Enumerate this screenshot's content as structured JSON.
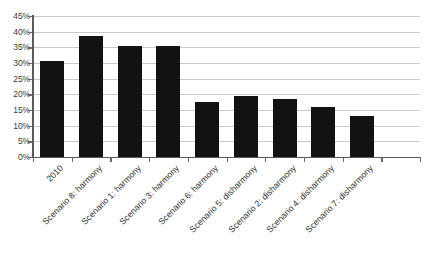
{
  "chart_data": {
    "type": "bar",
    "title": "",
    "subtitle": "",
    "xlabel": "",
    "ylabel": "",
    "categories": [
      "2010",
      "Scenario 8: harmony",
      "Scenario 1: harmony",
      "Scenario 3: harmony",
      "Scenario 6: harmony",
      "Scenario 5: disharmony",
      "Scenario 2: disharmony",
      "Scenario 4: disharmony",
      "Scenario 7: disharmony"
    ],
    "values": [
      30.5,
      38.5,
      35.5,
      35.5,
      17.5,
      19.5,
      18.5,
      16.0,
      13.0
    ],
    "value_labels": [
      "",
      "",
      "",
      "",
      "",
      "",
      "",
      "",
      ""
    ],
    "ylim": [
      0,
      45
    ],
    "ytick_values": [
      0,
      5,
      10,
      15,
      20,
      25,
      30,
      35,
      40,
      45
    ],
    "ytick_labels": [
      "0%",
      "5%",
      "10%",
      "15%",
      "20%",
      "25%",
      "30%",
      "35%",
      "40%",
      "45%"
    ],
    "grid": true,
    "grid_axis": "y",
    "legend": false,
    "legend_position": "none",
    "empty_trailing_slots": 1,
    "series": [
      {
        "name": "share",
        "values": [
          30.5,
          38.5,
          35.5,
          35.5,
          17.5,
          19.5,
          18.5,
          16.0,
          13.0
        ]
      }
    ]
  },
  "style": {
    "bar_color": "#121212",
    "grid_color": "#c8c8c8",
    "axis_color": "#5a5a5a",
    "tick_label_color": "#3a3a3a",
    "category_label_color": "#2f2f2f",
    "background_color": "#ffffff"
  }
}
